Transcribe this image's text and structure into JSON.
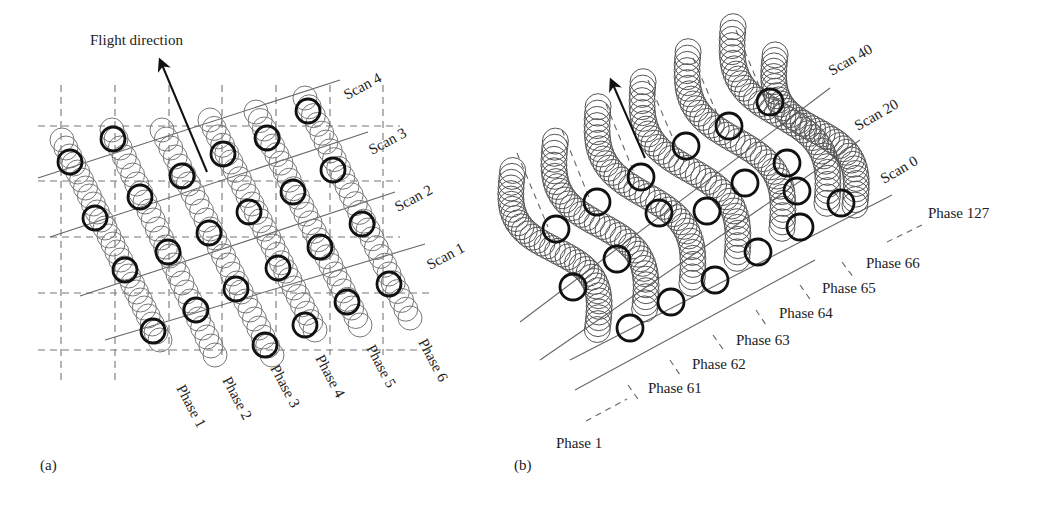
{
  "panel_a": {
    "label": "(a)",
    "flight_direction_label": "Flight direction",
    "scan_labels": [
      "Scan 4",
      "Scan 3",
      "Scan 2",
      "Scan 1"
    ],
    "phase_labels": [
      "Phase 1",
      "Phase 2",
      "Phase 3",
      "Phase 4",
      "Phase 5",
      "Phase 6"
    ],
    "grid_x": [
      61,
      115,
      169,
      222,
      276,
      330,
      383
    ],
    "grid_y": [
      126,
      181,
      237,
      293,
      350
    ]
  },
  "panel_b": {
    "label": "(b)",
    "scan_labels": [
      "Scan 40",
      "Scan 20",
      "Scan 0"
    ],
    "phase_labels": [
      "Phase 127",
      "Phase 66",
      "Phase 65",
      "Phase 64",
      "Phase 63",
      "Phase 62",
      "Phase 61",
      "Phase 1"
    ]
  },
  "colors": {
    "ink": "#111111",
    "grid": "#777777",
    "background": "#ffffff"
  }
}
